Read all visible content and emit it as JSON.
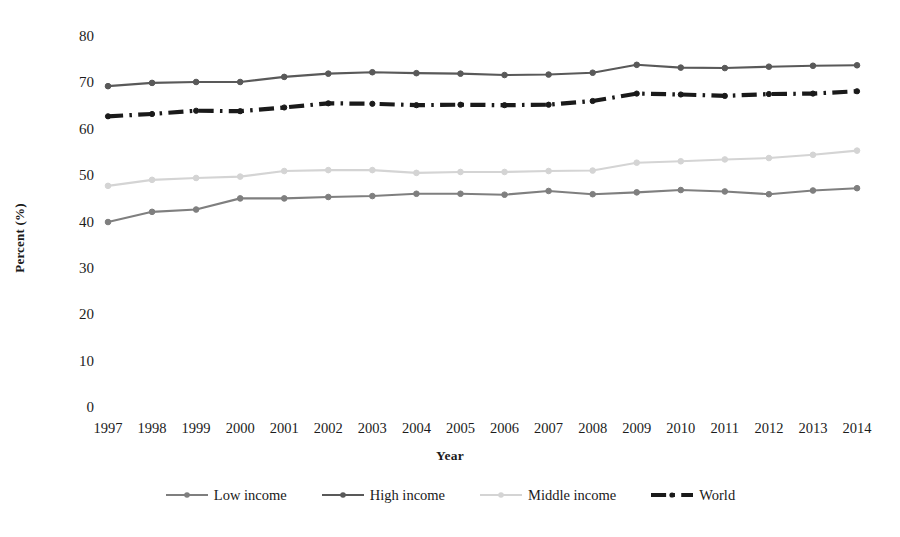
{
  "chart_data": {
    "type": "line",
    "title": "",
    "xlabel": "Year",
    "ylabel": "Percent (%)",
    "categories": [
      "1997",
      "1998",
      "1999",
      "2000",
      "2001",
      "2002",
      "2003",
      "2004",
      "2005",
      "2006",
      "2007",
      "2008",
      "2009",
      "2010",
      "2011",
      "2012",
      "2013",
      "2014"
    ],
    "x": [
      1997,
      1998,
      1999,
      2000,
      2001,
      2002,
      2003,
      2004,
      2005,
      2006,
      2007,
      2008,
      2009,
      2010,
      2011,
      2012,
      2013,
      2014
    ],
    "ylim": [
      0,
      80
    ],
    "yticks": [
      0,
      10,
      20,
      30,
      40,
      50,
      60,
      70,
      80
    ],
    "xlim": [
      1997,
      2014
    ],
    "grid": false,
    "legend_position": "bottom",
    "series": [
      {
        "name": "Low income",
        "color": "#7f7f7f",
        "style": "solid",
        "marker": "circle",
        "values": [
          40.1,
          42.3,
          42.8,
          45.2,
          45.2,
          45.5,
          45.7,
          46.2,
          46.2,
          46.0,
          46.8,
          46.1,
          46.5,
          47.0,
          46.7,
          46.1,
          46.9,
          47.4
        ]
      },
      {
        "name": "High income",
        "color": "#595959",
        "style": "solid",
        "marker": "circle",
        "values": [
          69.4,
          70.1,
          70.3,
          70.3,
          71.4,
          72.1,
          72.4,
          72.2,
          72.1,
          71.8,
          71.9,
          72.3,
          74.0,
          73.4,
          73.3,
          73.6,
          73.8,
          73.9
        ]
      },
      {
        "name": "Middle income",
        "color": "#d4d4d4",
        "style": "solid",
        "marker": "circle",
        "values": [
          47.9,
          49.2,
          49.6,
          49.9,
          51.1,
          51.3,
          51.3,
          50.7,
          50.9,
          50.9,
          51.1,
          51.2,
          52.9,
          53.2,
          53.6,
          53.9,
          54.6,
          55.5
        ]
      },
      {
        "name": "World",
        "color": "#1a1a1a",
        "style": "dash-dot",
        "marker": "circle",
        "values": [
          62.9,
          63.4,
          64.1,
          64.0,
          64.8,
          65.7,
          65.6,
          65.3,
          65.4,
          65.3,
          65.4,
          66.2,
          67.8,
          67.6,
          67.3,
          67.7,
          67.8,
          68.3
        ]
      }
    ]
  },
  "axes": {
    "y_title": "Percent (%)",
    "x_title": "Year",
    "y_tick_labels": [
      "80",
      "70",
      "60",
      "50",
      "40",
      "30",
      "20",
      "10",
      "0"
    ],
    "x_tick_labels": [
      "1997",
      "1998",
      "1999",
      "2000",
      "2001",
      "2002",
      "2003",
      "2004",
      "2005",
      "2006",
      "2007",
      "2008",
      "2009",
      "2010",
      "2011",
      "2012",
      "2013",
      "2014"
    ]
  },
  "legend": {
    "items": [
      {
        "label": "Low income",
        "color": "#7f7f7f",
        "style": "solid"
      },
      {
        "label": "High income",
        "color": "#595959",
        "style": "solid"
      },
      {
        "label": "Middle income",
        "color": "#d4d4d4",
        "style": "solid"
      },
      {
        "label": "World",
        "color": "#1a1a1a",
        "style": "dash-dot"
      }
    ]
  }
}
